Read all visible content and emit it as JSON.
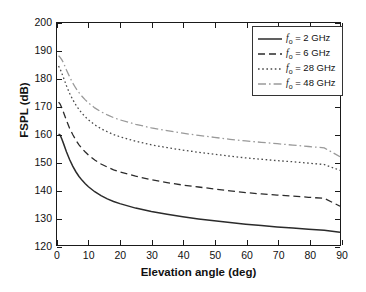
{
  "chart_data": {
    "type": "line",
    "title": "",
    "xlabel": "Elevation angle (deg)",
    "ylabel": "FSPL (dB)",
    "xlim": [
      0,
      90
    ],
    "ylim": [
      120,
      200
    ],
    "xticks": [
      0,
      10,
      20,
      30,
      40,
      50,
      60,
      70,
      80,
      90
    ],
    "yticks": [
      120,
      130,
      140,
      150,
      160,
      170,
      180,
      190,
      200
    ],
    "grid": false,
    "legend_position": "upper right",
    "x": [
      0.5,
      1,
      1.5,
      2,
      3,
      4,
      5,
      6,
      7,
      8,
      9,
      10,
      12,
      14,
      16,
      18,
      20,
      25,
      30,
      35,
      40,
      45,
      50,
      55,
      60,
      65,
      70,
      75,
      80,
      85,
      90
    ],
    "series": [
      {
        "name": "f_o = 2 GHz",
        "label": "2 GHz",
        "frequency_ghz": 2,
        "linestyle": "solid",
        "color": "#2b2b2b",
        "values": [
          160.0,
          159.6,
          158.3,
          156.8,
          153.6,
          150.8,
          148.4,
          146.4,
          144.7,
          143.3,
          142.1,
          141.0,
          139.2,
          137.8,
          136.6,
          135.7,
          134.9,
          133.3,
          132.1,
          131.1,
          130.2,
          129.4,
          128.7,
          128.1,
          127.5,
          127.0,
          126.5,
          126.1,
          125.7,
          125.3,
          124.6
        ]
      },
      {
        "name": "f_o = 6 GHz",
        "label": "6 GHz",
        "frequency_ghz": 6,
        "linestyle": "dashed",
        "color": "#2b2b2b",
        "values": [
          171.5,
          170.8,
          169.5,
          168.0,
          164.9,
          162.1,
          159.8,
          157.8,
          156.1,
          154.7,
          153.5,
          152.4,
          150.6,
          149.2,
          148.1,
          147.1,
          146.3,
          144.8,
          143.5,
          142.5,
          141.6,
          140.9,
          140.2,
          139.5,
          138.9,
          138.4,
          138.0,
          137.6,
          137.2,
          136.8,
          134.0
        ]
      },
      {
        "name": "f_o = 28 GHz",
        "label": "28 GHz",
        "frequency_ghz": 28,
        "linestyle": "dotted",
        "color": "#4a4a4a",
        "values": [
          184.5,
          183.4,
          182.0,
          180.5,
          177.4,
          174.7,
          172.4,
          170.5,
          168.8,
          167.4,
          166.2,
          165.1,
          163.3,
          161.9,
          160.8,
          159.8,
          159.0,
          157.4,
          156.1,
          155.1,
          154.2,
          153.4,
          152.7,
          152.0,
          151.4,
          150.9,
          150.4,
          150.0,
          149.5,
          149.0,
          146.9
        ]
      },
      {
        "name": "f_o = 48 GHz",
        "label": "48 GHz",
        "frequency_ghz": 48,
        "linestyle": "dashdot",
        "color": "#9a9a9a",
        "values": [
          188.2,
          187.6,
          186.8,
          185.8,
          183.1,
          180.6,
          178.4,
          176.5,
          174.9,
          173.5,
          172.3,
          171.2,
          169.4,
          168.0,
          166.9,
          165.9,
          165.1,
          163.5,
          162.2,
          161.2,
          160.3,
          159.5,
          158.8,
          158.1,
          157.5,
          157.0,
          156.5,
          156.0,
          155.5,
          155.0,
          151.8
        ]
      }
    ]
  },
  "legend": {
    "entries": [
      {
        "prefix": "f",
        "sub": "o",
        "rest": "= 2 GHz",
        "style": "solid"
      },
      {
        "prefix": "f",
        "sub": "o",
        "rest": "= 6 GHz",
        "style": "dashed"
      },
      {
        "prefix": "f",
        "sub": "o",
        "rest": "= 28 GHz",
        "style": "dotted"
      },
      {
        "prefix": "f",
        "sub": "o",
        "rest": "= 48 GHz",
        "style": "dashdot"
      }
    ]
  },
  "colors": {
    "axis": "#1a1a1a",
    "text": "#111111",
    "background": "#ffffff",
    "legend_border": "#333333"
  }
}
